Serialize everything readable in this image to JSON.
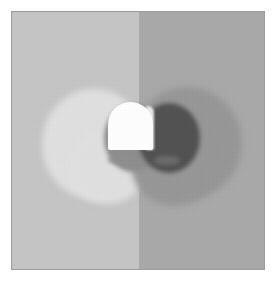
{
  "image": {
    "title": "Lightness contrast stimulus",
    "description": "A white dome-shaped object centered on a vertically split gray background",
    "width": 279,
    "height": 291
  },
  "frame": {
    "border_color": "#9d9d9d",
    "margin_color": "#ffffff",
    "label": "image-frame"
  },
  "background": {
    "left_half": {
      "name": "light-background-half",
      "color": "#c5c5c5",
      "label": "Light gray field"
    },
    "right_half": {
      "name": "dark-background-half",
      "color": "#a9a9a9",
      "label": "Dark gray field"
    },
    "split_position_pct": 50.2
  },
  "illumination": {
    "left_glow": {
      "name": "left-illumination-blob",
      "color": "#e1e1e1",
      "label": "Light glow region"
    },
    "right_glow": {
      "name": "right-illumination-blob",
      "color": "#979797",
      "label": "Dark glow region"
    }
  },
  "shadows": {
    "left_crescent": {
      "name": "left-cast-shadow",
      "color": "#8e8e8e",
      "label": "Medium shadow crescent"
    },
    "right_crescent": {
      "name": "right-cast-shadow",
      "color": "#515151",
      "label": "Deep shadow crescent"
    },
    "left_contact": {
      "name": "left-contact-shadow",
      "color": "#8f8f8f",
      "label": "Left base contact shadow"
    },
    "right_contact": {
      "name": "right-contact-shadow",
      "color": "#6b6b6b",
      "label": "Right base contact shadow"
    }
  },
  "object": {
    "name": "white-dome",
    "color": "#ffffff",
    "shade_color": "#e9e9e9",
    "label": "White dome object"
  }
}
